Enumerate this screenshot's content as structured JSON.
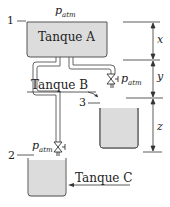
{
  "diagram": {
    "tanks": [
      {
        "id": "A",
        "label": "Tanque A"
      },
      {
        "id": "B",
        "label": "Tanque B"
      },
      {
        "id": "C",
        "label": "Tanque C"
      }
    ],
    "points": [
      {
        "id": "1",
        "label": "1"
      },
      {
        "id": "2",
        "label": "2"
      },
      {
        "id": "3",
        "label": "3"
      }
    ],
    "pressure": {
      "symbol": "p",
      "subscript": "atm"
    },
    "dimensions": [
      {
        "id": "x",
        "label": "x"
      },
      {
        "id": "y",
        "label": "y"
      },
      {
        "id": "z",
        "label": "z"
      }
    ],
    "colors": {
      "tank_fill": "#dcdcdc",
      "line": "#333333",
      "tank_border": "#555555"
    }
  }
}
